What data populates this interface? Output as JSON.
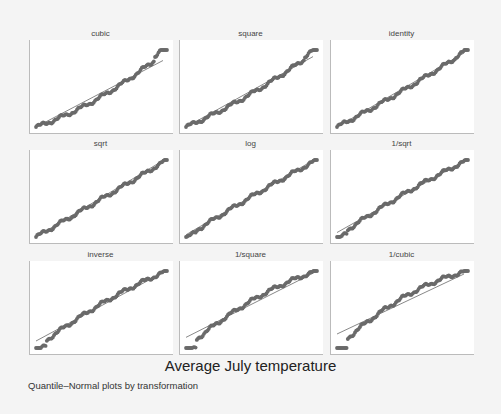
{
  "chart_data": {
    "type": "scatter",
    "title": "Average July temperature",
    "subtitle": "Quantile–Normal plots by transformation",
    "layout": {
      "rows": 3,
      "cols": 3,
      "grid": false,
      "axes_ticks": false
    },
    "reference_line": "45-degree fitted normal line in each panel",
    "panels": [
      {
        "label": "cubic",
        "shape": "convex (right-skewed upper tail)",
        "curvature": 0.35
      },
      {
        "label": "square",
        "shape": "slightly convex",
        "curvature": 0.22
      },
      {
        "label": "identity",
        "shape": "near linear",
        "curvature": 0.1
      },
      {
        "label": "sqrt",
        "shape": "near linear",
        "curvature": 0.02
      },
      {
        "label": "log",
        "shape": "near linear, slight concave",
        "curvature": -0.08
      },
      {
        "label": "1/sqrt",
        "shape": "slightly concave",
        "curvature": -0.16
      },
      {
        "label": "inverse",
        "shape": "concave",
        "curvature": -0.25
      },
      {
        "label": "1/square",
        "shape": "concave",
        "curvature": -0.38
      },
      {
        "label": "1/cubic",
        "shape": "strongly concave",
        "curvature": -0.5
      }
    ],
    "xlabel": "",
    "ylabel": ""
  },
  "colors": {
    "marker": "#6a6a6a",
    "line": "#555555",
    "plot_bg": "#ffffff",
    "page_bg": "#f4f4f4"
  }
}
